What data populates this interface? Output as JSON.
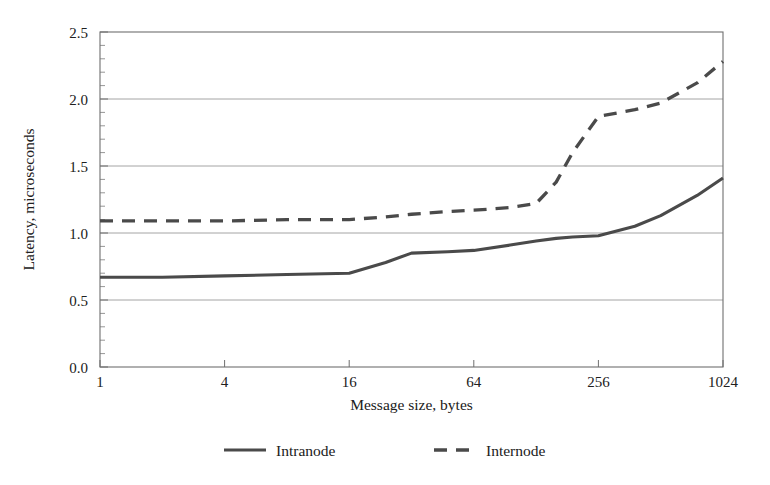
{
  "chart_data": {
    "type": "line",
    "title": "",
    "subtitle": "",
    "xlabel": "Message size, bytes",
    "ylabel": "Latency, microseconds",
    "xscale": "log2",
    "xlim": [
      1,
      1024
    ],
    "ylim": [
      0.0,
      2.5
    ],
    "yticks": [
      "0.0",
      "0.5",
      "1.0",
      "1.5",
      "2.0",
      "2.5"
    ],
    "ytick_values": [
      0.0,
      0.5,
      1.0,
      1.5,
      2.0,
      2.5
    ],
    "y_minor_tick_step": 0.1,
    "xticks": [
      "1",
      "4",
      "16",
      "64",
      "256",
      "1024"
    ],
    "xtick_values": [
      1,
      4,
      16,
      64,
      256,
      1024
    ],
    "grid": "horizontal",
    "legend_position": "bottom",
    "x": [
      1,
      2,
      4,
      8,
      16,
      24,
      32,
      48,
      64,
      96,
      128,
      160,
      192,
      256,
      384,
      512,
      768,
      1024
    ],
    "series": [
      {
        "name": "Intranode",
        "style": "solid",
        "color": "#4a4a4a",
        "values": [
          0.67,
          0.67,
          0.68,
          0.69,
          0.7,
          0.78,
          0.85,
          0.86,
          0.87,
          0.91,
          0.94,
          0.96,
          0.97,
          0.98,
          1.05,
          1.13,
          1.28,
          1.41
        ]
      },
      {
        "name": "Internode",
        "style": "dashed",
        "color": "#4a4a4a",
        "values": [
          1.09,
          1.09,
          1.09,
          1.1,
          1.1,
          1.12,
          1.14,
          1.16,
          1.17,
          1.19,
          1.22,
          1.38,
          1.6,
          1.87,
          1.92,
          1.97,
          2.12,
          2.28
        ]
      }
    ]
  },
  "legend": {
    "items": [
      {
        "label": "Intranode",
        "style": "solid"
      },
      {
        "label": "Internode",
        "style": "dashed"
      }
    ]
  }
}
